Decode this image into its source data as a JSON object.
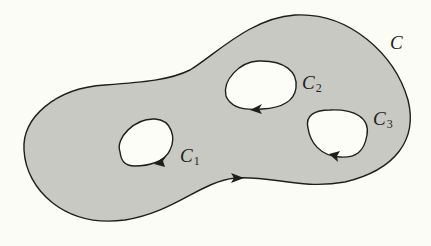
{
  "figure": {
    "colors": {
      "background": "#fcfcf6",
      "region_fill": "#c9c9c4",
      "hole_fill": "#fdfdf8",
      "stroke": "#1e1e1e"
    },
    "labels": {
      "outer": {
        "main": "C",
        "sub": ""
      },
      "c1": {
        "main": "C",
        "sub": "1"
      },
      "c2": {
        "main": "C",
        "sub": "2"
      },
      "c3": {
        "main": "C",
        "sub": "3"
      }
    },
    "curves": [
      {
        "id": "outer",
        "label": "C",
        "orientation": "counterclockwise"
      },
      {
        "id": "c1",
        "label": "C1",
        "orientation": "clockwise"
      },
      {
        "id": "c2",
        "label": "C2",
        "orientation": "clockwise"
      },
      {
        "id": "c3",
        "label": "C3",
        "orientation": "clockwise"
      }
    ]
  }
}
